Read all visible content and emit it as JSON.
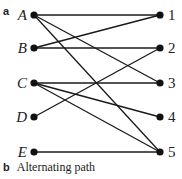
{
  "panel_a": {
    "label": "a"
  },
  "panel_b": {
    "label": "b",
    "caption": "Alternating path"
  },
  "graph": {
    "left_nodes": [
      {
        "id": "A",
        "label": "A",
        "x": 34,
        "y": 15
      },
      {
        "id": "B",
        "label": "B",
        "x": 34,
        "y": 48
      },
      {
        "id": "C",
        "label": "C",
        "x": 34,
        "y": 83
      },
      {
        "id": "D",
        "label": "D",
        "x": 34,
        "y": 117
      },
      {
        "id": "E",
        "label": "E",
        "x": 34,
        "y": 152
      }
    ],
    "right_nodes": [
      {
        "id": "1",
        "label": "1",
        "x": 160,
        "y": 15
      },
      {
        "id": "2",
        "label": "2",
        "x": 160,
        "y": 48
      },
      {
        "id": "3",
        "label": "3",
        "x": 160,
        "y": 83
      },
      {
        "id": "4",
        "label": "4",
        "x": 160,
        "y": 117
      },
      {
        "id": "5",
        "label": "5",
        "x": 160,
        "y": 152
      }
    ],
    "edges": [
      [
        "A",
        "1"
      ],
      [
        "A",
        "3"
      ],
      [
        "A",
        "5"
      ],
      [
        "B",
        "1"
      ],
      [
        "B",
        "2"
      ],
      [
        "C",
        "3"
      ],
      [
        "C",
        "4"
      ],
      [
        "C",
        "5"
      ],
      [
        "D",
        "2"
      ],
      [
        "E",
        "5"
      ]
    ],
    "colors": {
      "edge": "#1a1a1a",
      "node": "#111111"
    }
  }
}
